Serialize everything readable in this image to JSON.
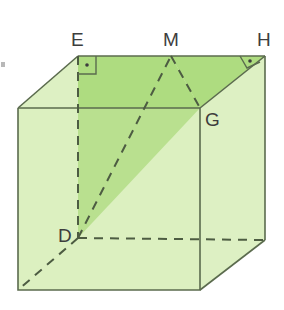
{
  "figure": {
    "kind": "geometry-diagram",
    "shape": "cube"
  },
  "labels": {
    "e": "E",
    "m": "M",
    "h": "H",
    "g": "G",
    "d": "D"
  },
  "markers": {
    "right_angle_at_e": "right-angle-marker",
    "right_angle_at_h": "right-angle-marker"
  },
  "colors": {
    "face_light": "#ddf0c3",
    "face_mid": "#cdeaa8",
    "face_dark": "#a8d97a",
    "face_top_shade": "#b6de8c",
    "edge": "#5b6b4e",
    "edge_light": "#7b8a6a",
    "dashed": "#4d5c42",
    "label": "#3d3d3d",
    "background": "#ffffff"
  },
  "geometry": {
    "front_top_left": [
      18,
      108
    ],
    "front_top_right": [
      200,
      108
    ],
    "front_bottom_right": [
      200,
      290
    ],
    "front_bottom_left": [
      18,
      290
    ],
    "back_top_left": [
      78,
      56
    ],
    "back_top_right": [
      265,
      56
    ],
    "back_bottom_right": [
      265,
      240
    ],
    "back_bottom_left": [
      78,
      238
    ],
    "midpoint_m": [
      171,
      56
    ]
  }
}
